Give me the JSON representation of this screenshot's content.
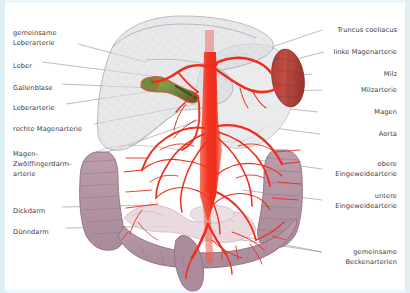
{
  "figure": {
    "language": "de",
    "background_color": "#ffffff",
    "frame_color": "#dff0f5",
    "label_color": "#3a3a42",
    "leader_line_color": "#7b7b86"
  },
  "palette": {
    "artery_red": "#ee2d1e",
    "artery_red_light": "#f4553f",
    "aorta_red": "#f2341f",
    "liver_gray": "#d9dadd",
    "liver_gray_edge": "#8d9196",
    "stomach_gray": "#e9eaec",
    "spleen_red": "#b8463d",
    "spleen_red_dark": "#93342d",
    "gallbladder_green": "#5f7d33",
    "colon_mauve": "#b294a4",
    "colon_mauve_edge": "#8e6e80",
    "small_bowel_pink": "#e3cfd6"
  },
  "labels_left": [
    {
      "id": "gemeinsame-leberarterie",
      "text": "gemeinsame\nLeberarterie",
      "x": 13,
      "y": 28,
      "lines": 2
    },
    {
      "id": "leber",
      "text": "Leber",
      "x": 13,
      "y": 61,
      "lines": 1
    },
    {
      "id": "gallenblase",
      "text": "Gallenblase",
      "x": 13,
      "y": 83,
      "lines": 1
    },
    {
      "id": "leberarterie",
      "text": "Leberarterie",
      "x": 13,
      "y": 103,
      "lines": 1
    },
    {
      "id": "rechte-magenarterie",
      "text": "rechte Magenarterie",
      "x": 13,
      "y": 124,
      "lines": 1
    },
    {
      "id": "magen-zwoelffingerdarm-arterie",
      "text": "Magen-\nZwölffingerdarm-\narterie",
      "x": 13,
      "y": 149,
      "lines": 3
    },
    {
      "id": "dickdarm",
      "text": "Dickdarm",
      "x": 13,
      "y": 206,
      "lines": 1
    },
    {
      "id": "duenndarm",
      "text": "Dünndarm",
      "x": 13,
      "y": 227,
      "lines": 1
    }
  ],
  "labels_right": [
    {
      "id": "truncus-coeliacus",
      "text": "Truncus coeliacus",
      "x": 397,
      "y": 29,
      "lines": 1
    },
    {
      "id": "linke-magenarterie",
      "text": "linke Magenarterie",
      "x": 397,
      "y": 51,
      "lines": 1
    },
    {
      "id": "milz",
      "text": "Milz",
      "x": 397,
      "y": 73,
      "lines": 1
    },
    {
      "id": "milzarterie",
      "text": "Milzarterie",
      "x": 397,
      "y": 89,
      "lines": 1
    },
    {
      "id": "magen",
      "text": "Magen",
      "x": 397,
      "y": 111,
      "lines": 1
    },
    {
      "id": "aorta",
      "text": "Aorta",
      "x": 397,
      "y": 133,
      "lines": 1
    },
    {
      "id": "obere-eingeweidearterie",
      "text": "obere\nEingeweidearterie",
      "x": 397,
      "y": 163,
      "lines": 2
    },
    {
      "id": "untere-eingeweidearterie",
      "text": "untere\nEingeweidearterie",
      "x": 397,
      "y": 195,
      "lines": 2
    },
    {
      "id": "gemeinsame-beckenarterien",
      "text": "gemeinsame\nBeckenarterien",
      "x": 397,
      "y": 251,
      "lines": 2
    }
  ],
  "organs": [
    {
      "id": "liver",
      "name": "Leber",
      "color": "#d9dadd",
      "note": "large translucent gray mass upper left/center"
    },
    {
      "id": "gallbladder",
      "name": "Gallenblase",
      "color": "#5f7d33",
      "note": "small green pear shape on liver underside"
    },
    {
      "id": "stomach",
      "name": "Magen",
      "color": "#e9eaec",
      "note": "pale translucent gray, centre right"
    },
    {
      "id": "spleen",
      "name": "Milz",
      "color": "#b8463d",
      "note": "dark red oval at right of stomach"
    },
    {
      "id": "colon",
      "name": "Dickdarm",
      "color": "#b294a4",
      "note": "mauve haustrated frame around abdomen"
    },
    {
      "id": "small-bowel",
      "name": "Dünndarm",
      "color": "#e3cfd6",
      "note": "pale pink coils lower centre"
    },
    {
      "id": "aorta",
      "name": "Aorta",
      "color": "#f2341f",
      "note": "vertical bright red trunk in midline"
    }
  ]
}
